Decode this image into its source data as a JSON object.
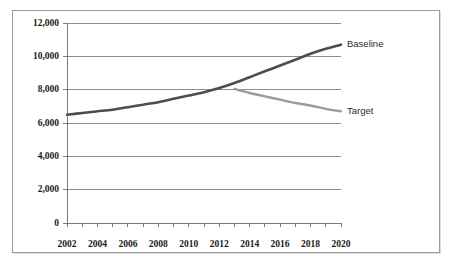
{
  "chart_data": {
    "type": "line",
    "title": "",
    "subtitle": "",
    "xlabel": "",
    "ylabel": "",
    "xlim": [
      2002,
      2020
    ],
    "ylim": [
      0,
      12000
    ],
    "grid": true,
    "legend_position": "end-of-line-annotation",
    "x": [
      2002,
      2003,
      2004,
      2005,
      2006,
      2007,
      2008,
      2009,
      2010,
      2011,
      2012,
      2013,
      2014,
      2015,
      2016,
      2017,
      2018,
      2019,
      2020
    ],
    "y_tick_labels": [
      "0",
      "2,000",
      "4,000",
      "6,000",
      "8,000",
      "10,000",
      "12,000"
    ],
    "y_tick_values": [
      0,
      2000,
      4000,
      6000,
      8000,
      10000,
      12000
    ],
    "x_tick_labels": [
      "2002",
      "2004",
      "2006",
      "2008",
      "2010",
      "2012",
      "2014",
      "2016",
      "2018",
      "2020"
    ],
    "x_tick_values": [
      2002,
      2004,
      2006,
      2008,
      2010,
      2012,
      2014,
      2016,
      2018,
      2020
    ],
    "x_minor_tick_values": [
      2002,
      2003,
      2004,
      2005,
      2006,
      2007,
      2008,
      2009,
      2010,
      2011,
      2012,
      2013,
      2014,
      2015,
      2016,
      2017,
      2018,
      2019,
      2020
    ],
    "series": [
      {
        "name": "Baseline",
        "label": "Baseline",
        "color": "#4d4d4d",
        "width": 2.6,
        "x": [
          2002,
          2003,
          2004,
          2005,
          2006,
          2007,
          2008,
          2009,
          2010,
          2011,
          2012,
          2013,
          2014,
          2015,
          2016,
          2017,
          2018,
          2019,
          2020
        ],
        "values": [
          6500,
          6600,
          6700,
          6800,
          6950,
          7100,
          7250,
          7450,
          7650,
          7850,
          8100,
          8400,
          8750,
          9100,
          9450,
          9800,
          10150,
          10450,
          10700
        ]
      },
      {
        "name": "Target",
        "label": "Target",
        "color": "#9b9b9b",
        "width": 2.4,
        "x": [
          2013,
          2014,
          2015,
          2016,
          2017,
          2018,
          2019,
          2020
        ],
        "values": [
          8050,
          7800,
          7600,
          7400,
          7200,
          7050,
          6850,
          6700
        ]
      }
    ],
    "annotations": [
      {
        "text": "Baseline",
        "x": 2020,
        "y": 10700
      },
      {
        "text": "Target",
        "x": 2020,
        "y": 6700
      }
    ],
    "colors": {
      "baseline": "#4d4d4d",
      "target": "#9b9b9b",
      "gridline": "#8d8d8d",
      "axis": "#7a7a7a",
      "frame_border": "#9a9a9a",
      "background": "#ffffff",
      "text": "#1a1a1a"
    }
  }
}
